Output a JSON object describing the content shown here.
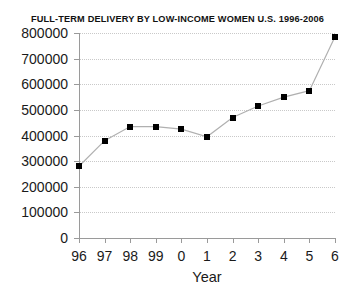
{
  "chart_data": {
    "type": "line",
    "title": "FULL-TERM DELIVERY BY LOW-INCOME WOMEN U.S. 1996-2006",
    "xlabel": "Year",
    "ylabel": "",
    "x": [
      "96",
      "97",
      "98",
      "99",
      "0",
      "1",
      "2",
      "3",
      "4",
      "5",
      "6"
    ],
    "categories": [
      "96",
      "97",
      "98",
      "99",
      "0",
      "1",
      "2",
      "3",
      "4",
      "5",
      "6"
    ],
    "values": [
      280000,
      380000,
      435000,
      435000,
      425000,
      395000,
      470000,
      515000,
      550000,
      575000,
      785000
    ],
    "series": [
      {
        "name": "Full-term deliveries",
        "values": [
          280000,
          380000,
          435000,
          435000,
          425000,
          395000,
          470000,
          515000,
          550000,
          575000,
          785000
        ]
      }
    ],
    "ylim": [
      0,
      800000
    ],
    "ytick_values": [
      0,
      100000,
      200000,
      300000,
      400000,
      500000,
      600000,
      700000,
      800000
    ],
    "ytick_labels": [
      "0",
      "100000",
      "200000",
      "300000",
      "400000",
      "500000",
      "600000",
      "700000",
      "800000"
    ],
    "xtick_labels": [
      "96",
      "97",
      "98",
      "99",
      "0",
      "1",
      "2",
      "3",
      "4",
      "5",
      "6"
    ],
    "grid": "horizontal-dotted",
    "legend": "none",
    "marker": "filled-square",
    "colors": {
      "line": "#b0b0b0",
      "marker": "#000000",
      "grid": "#c9c9c9",
      "axis": "#9a9a9a",
      "text": "#1a1a1a",
      "background": "#ffffff"
    }
  }
}
